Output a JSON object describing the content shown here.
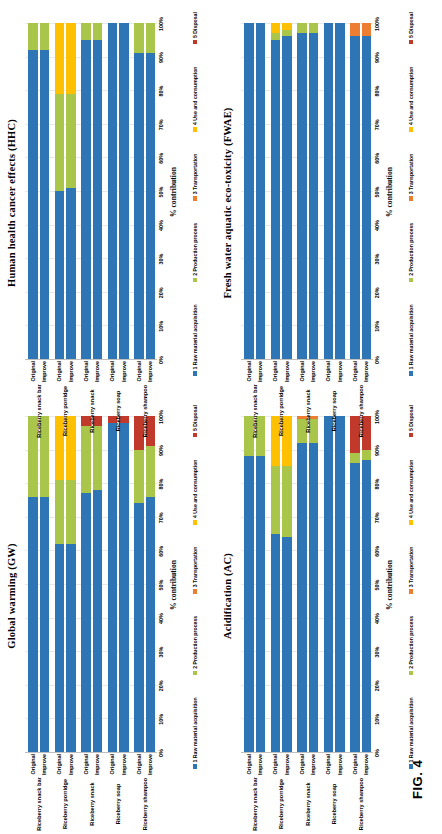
{
  "figure": {
    "label": "FIG. 4",
    "axis_title": "% contribution",
    "tick_labels": [
      "0%",
      "10%",
      "20%",
      "30%",
      "40%",
      "50%",
      "60%",
      "70%",
      "80%",
      "90%",
      "100%"
    ],
    "scenarios": [
      "Original",
      "Improve"
    ],
    "products": [
      "Riceberry snack bar",
      "Riceberry porridge",
      "Riceberry snack",
      "Riceberry soap",
      "Riceberry shampoo"
    ],
    "legend": [
      {
        "key": "1 Raw material acquisition",
        "color": "#2E75B6"
      },
      {
        "key": "2 Production process",
        "color": "#A9C64B"
      },
      {
        "key": "3 Transportation",
        "color": "#ED7D31"
      },
      {
        "key": "4 Use and consumption",
        "color": "#FFC000"
      },
      {
        "key": "5 Disposal",
        "color": "#C0392B"
      }
    ]
  },
  "chart_data": [
    {
      "id": "gw",
      "type": "bar",
      "stacked": true,
      "title": "Global warming (GW)",
      "xlabel": "",
      "ylabel": "% contribution",
      "ylim": [
        0,
        100
      ],
      "grid": true,
      "legend_position": "bottom",
      "categories": [
        "Riceberry snack bar - Original",
        "Riceberry snack bar - Improve",
        "Riceberry porridge - Original",
        "Riceberry porridge - Improve",
        "Riceberry snack - Original",
        "Riceberry snack - Improve",
        "Riceberry soap - Original",
        "Riceberry soap - Improve",
        "Riceberry shampoo - Original",
        "Riceberry shampoo - Improve"
      ],
      "series": [
        {
          "name": "1 Raw material acquisition",
          "values": [
            76,
            76,
            62,
            62,
            77,
            78,
            98,
            98,
            74,
            76
          ]
        },
        {
          "name": "2 Production process",
          "values": [
            24,
            24,
            19,
            19,
            20,
            19,
            0,
            0,
            16,
            15
          ]
        },
        {
          "name": "3 Transportation",
          "values": [
            0,
            0,
            0,
            0,
            0,
            0,
            0,
            0,
            0,
            0
          ]
        },
        {
          "name": "4 Use and consumption",
          "values": [
            0,
            0,
            19,
            19,
            0,
            0,
            0,
            0,
            0,
            0
          ]
        },
        {
          "name": "5 Disposal",
          "values": [
            0,
            0,
            0,
            0,
            3,
            3,
            2,
            2,
            10,
            9
          ]
        }
      ]
    },
    {
      "id": "hhc",
      "type": "bar",
      "stacked": true,
      "title": "Human health cancer effects (HHC)",
      "xlabel": "",
      "ylabel": "% contribution",
      "ylim": [
        0,
        100
      ],
      "grid": true,
      "legend_position": "bottom",
      "categories": [
        "Riceberry snack bar - Original",
        "Riceberry snack bar - Improve",
        "Riceberry porridge - Original",
        "Riceberry porridge - Improve",
        "Riceberry snack - Original",
        "Riceberry snack - Improve",
        "Riceberry soap - Original",
        "Riceberry soap - Improve",
        "Riceberry shampoo - Original",
        "Riceberry shampoo - Improve"
      ],
      "series": [
        {
          "name": "1 Raw material acquisition",
          "values": [
            92,
            92,
            50,
            51,
            95,
            95,
            100,
            100,
            91,
            91
          ]
        },
        {
          "name": "2 Production process",
          "values": [
            8,
            8,
            29,
            28,
            5,
            5,
            0,
            0,
            9,
            9
          ]
        },
        {
          "name": "3 Transportation",
          "values": [
            0,
            0,
            0,
            0,
            0,
            0,
            0,
            0,
            0,
            0
          ]
        },
        {
          "name": "4 Use and consumption",
          "values": [
            0,
            0,
            21,
            21,
            0,
            0,
            0,
            0,
            0,
            0
          ]
        },
        {
          "name": "5 Disposal",
          "values": [
            0,
            0,
            0,
            0,
            0,
            0,
            0,
            0,
            0,
            0
          ]
        }
      ]
    },
    {
      "id": "ac",
      "type": "bar",
      "stacked": true,
      "title": "Acidification (AC)",
      "xlabel": "",
      "ylabel": "% contribution",
      "ylim": [
        0,
        100
      ],
      "grid": true,
      "legend_position": "bottom",
      "categories": [
        "Riceberry snack bar - Original",
        "Riceberry snack bar - Improve",
        "Riceberry porridge - Original",
        "Riceberry porridge - Improve",
        "Riceberry snack - Original",
        "Riceberry snack - Improve",
        "Riceberry soap - Original",
        "Riceberry soap - Improve",
        "Riceberry shampoo - Original",
        "Riceberry shampoo - Improve"
      ],
      "series": [
        {
          "name": "1 Raw material acquisition",
          "values": [
            88,
            88,
            65,
            64,
            92,
            92,
            100,
            100,
            86,
            87
          ]
        },
        {
          "name": "2 Production process",
          "values": [
            12,
            12,
            20,
            21,
            7,
            7,
            0,
            0,
            3,
            3
          ]
        },
        {
          "name": "3 Transportation",
          "values": [
            0,
            0,
            0,
            0,
            1,
            1,
            0,
            0,
            0,
            0
          ]
        },
        {
          "name": "4 Use and consumption",
          "values": [
            0,
            0,
            15,
            15,
            0,
            0,
            0,
            0,
            0,
            0
          ]
        },
        {
          "name": "5 Disposal",
          "values": [
            0,
            0,
            0,
            0,
            0,
            0,
            0,
            0,
            11,
            10
          ]
        }
      ]
    },
    {
      "id": "fwae",
      "type": "bar",
      "stacked": true,
      "title": "Fresh water aquatic eco-toxicity (FWAE)",
      "xlabel": "",
      "ylabel": "% contribution",
      "ylim": [
        0,
        100
      ],
      "grid": true,
      "legend_position": "bottom",
      "categories": [
        "Riceberry snack bar - Original",
        "Riceberry snack bar - Improve",
        "Riceberry porridge - Original",
        "Riceberry porridge - Improve",
        "Riceberry snack - Original",
        "Riceberry snack - Improve",
        "Riceberry soap - Original",
        "Riceberry soap - Improve",
        "Riceberry shampoo - Original",
        "Riceberry shampoo - Improve"
      ],
      "series": [
        {
          "name": "1 Raw material acquisition",
          "values": [
            100,
            100,
            95,
            96,
            97,
            97,
            100,
            100,
            96,
            96
          ]
        },
        {
          "name": "2 Production process",
          "values": [
            0,
            0,
            2,
            2,
            3,
            3,
            0,
            0,
            0,
            0
          ]
        },
        {
          "name": "3 Transportation",
          "values": [
            0,
            0,
            0,
            0,
            0,
            0,
            0,
            0,
            4,
            4
          ]
        },
        {
          "name": "4 Use and consumption",
          "values": [
            0,
            0,
            3,
            2,
            0,
            0,
            0,
            0,
            0,
            0
          ]
        },
        {
          "name": "5 Disposal",
          "values": [
            0,
            0,
            0,
            0,
            0,
            0,
            0,
            0,
            0,
            0
          ]
        }
      ]
    }
  ]
}
